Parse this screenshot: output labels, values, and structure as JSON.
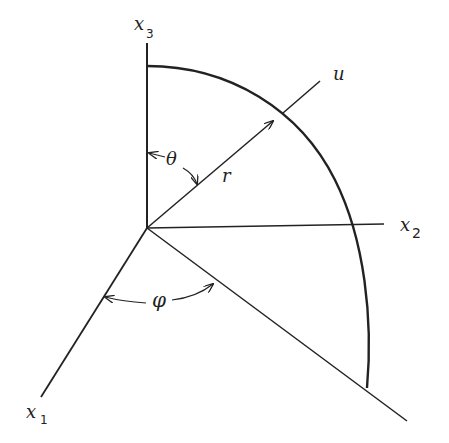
{
  "diagram": {
    "labels": {
      "x1": "x",
      "x1_sub": "1",
      "x2": "x",
      "x2_sub": "2",
      "x3": "x",
      "x3_sub": "3",
      "u": "u",
      "r": "r",
      "theta": "θ",
      "phi": "φ"
    },
    "colors": {
      "line": "#222222",
      "background": "#ffffff"
    }
  }
}
